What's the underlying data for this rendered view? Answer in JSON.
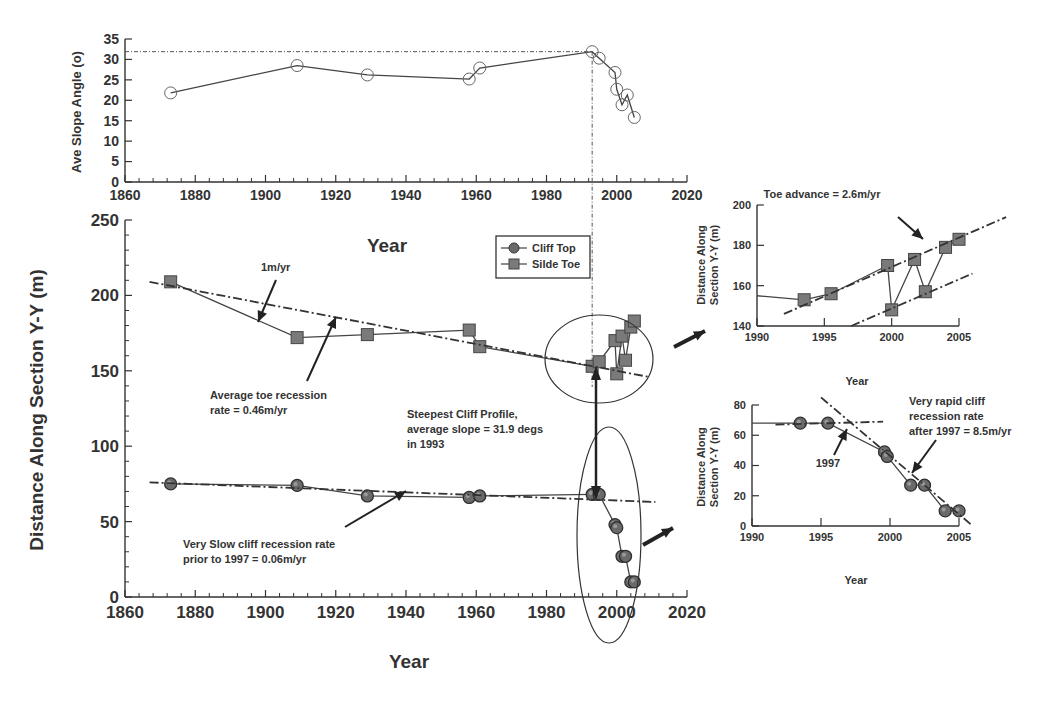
{
  "chart_data": [
    {
      "id": "slope",
      "type": "line",
      "ylabel": "Ave Slope Angle (o)",
      "xlabel": "",
      "xlim": [
        1860,
        2020
      ],
      "ylim": [
        0,
        35
      ],
      "xticks": [
        1860,
        1880,
        1900,
        1920,
        1940,
        1960,
        1980,
        2000,
        2020
      ],
      "yticks": [
        0,
        5,
        10,
        15,
        20,
        25,
        30,
        35
      ],
      "series": [
        {
          "name": "Ave Slope Angle",
          "marker": "open-circle",
          "x": [
            1873,
            1909,
            1929,
            1958,
            1961,
            1993,
            1995,
            1999.5,
            2000,
            2001.5,
            2003,
            2005
          ],
          "y": [
            21.8,
            28.5,
            26.2,
            25.2,
            27.9,
            31.9,
            30.3,
            26.8,
            22.7,
            18.9,
            21.3,
            15.8
          ]
        }
      ],
      "reference_lines": [
        {
          "type": "horizontal",
          "y": 31.9
        },
        {
          "type": "vertical",
          "x": 1993
        }
      ],
      "grid": false
    },
    {
      "id": "main",
      "type": "line",
      "title": "Year",
      "xlabel": "Year",
      "ylabel": "Distance Along Section Y-Y (m)",
      "xlim": [
        1860,
        2020
      ],
      "ylim": [
        0,
        250
      ],
      "xticks": [
        1860,
        1880,
        1900,
        1920,
        1940,
        1960,
        1980,
        2000,
        2020
      ],
      "yticks": [
        0,
        50,
        100,
        150,
        200,
        250
      ],
      "legend": {
        "position": "upper center",
        "entries": [
          "Cliff Top",
          "Silde Toe"
        ]
      },
      "series": [
        {
          "name": "Cliff Top",
          "marker": "filled-sphere",
          "x": [
            1873,
            1909,
            1929,
            1958,
            1961,
            1993,
            1995,
            1999.5,
            2000,
            2001.5,
            2002.5,
            2004,
            2005
          ],
          "y": [
            75,
            74,
            67,
            66,
            67,
            68,
            68,
            48,
            46,
            27,
            27,
            10,
            10
          ]
        },
        {
          "name": "Silde Toe",
          "marker": "filled-square",
          "x": [
            1873,
            1909,
            1929,
            1958,
            1961,
            1993,
            1995,
            1999.5,
            2000,
            2001.5,
            2002.5,
            2004,
            2005
          ],
          "y": [
            209,
            172,
            174,
            177,
            166,
            153,
            156,
            170,
            148,
            173,
            157,
            179,
            183
          ]
        }
      ],
      "trend_lines": [
        {
          "label": "1m/yr",
          "from": [
            1867,
            209
          ],
          "to": [
            2009,
            146
          ]
        },
        {
          "label": "Very Slow cliff recession rate prior to 1997 = 0.06m/yr",
          "from": [
            1867,
            76
          ],
          "to": [
            2011,
            63
          ]
        }
      ],
      "annotations": [
        "1m/yr",
        "Average toe recession rate = 0.46m/yr",
        "Steepest Cliff Profile, average slope = 31.9 degs in 1993",
        "Very Slow cliff recession rate prior to 1997 = 0.06m/yr"
      ],
      "grid": false
    },
    {
      "id": "inset_toe",
      "type": "line",
      "title": "Toe advance = 2.6m/yr",
      "xlabel": "Year",
      "ylabel": "Distance Along Section Y-Y (m)",
      "xlim": [
        1990,
        2005
      ],
      "ylim": [
        140,
        200
      ],
      "xticks": [
        1990,
        1995,
        2000,
        2005
      ],
      "yticks": [
        140,
        160,
        180,
        200
      ],
      "series": [
        {
          "name": "Silde Toe",
          "marker": "filled-square",
          "x": [
            1990,
            1993.5,
            1995.5,
            1999.7,
            2000,
            2001.7,
            2002.5,
            2004,
            2005
          ],
          "y": [
            155,
            153,
            156,
            170,
            148,
            173,
            157,
            179,
            183
          ]
        }
      ],
      "trend_lines": [
        {
          "from": [
            1992,
            146
          ],
          "to": [
            2008.5,
            194
          ]
        },
        {
          "from": [
            1997,
            140
          ],
          "to": [
            2006,
            166
          ]
        }
      ],
      "grid": false
    },
    {
      "id": "inset_cliff",
      "type": "line",
      "xlabel": "Year",
      "ylabel": "Distance Along Section Y-Y (m)",
      "xlim": [
        1990,
        2005
      ],
      "ylim": [
        0,
        80
      ],
      "xticks": [
        1990,
        1995,
        2000,
        2005
      ],
      "yticks": [
        0,
        20,
        40,
        60,
        80
      ],
      "series": [
        {
          "name": "Cliff Top",
          "marker": "filled-sphere",
          "x": [
            1990,
            1993.5,
            1995.5,
            1999.6,
            1999.8,
            2001.5,
            2002.5,
            2004,
            2005
          ],
          "y": [
            68,
            68,
            68,
            49,
            46,
            27,
            27,
            10,
            10
          ]
        }
      ],
      "trend_lines": [
        {
          "from": [
            1991.7,
            67
          ],
          "to": [
            1999.5,
            69
          ]
        },
        {
          "from": [
            1995,
            85
          ],
          "to": [
            2006,
            0
          ]
        }
      ],
      "annotations": [
        "1997",
        "Very rapid cliff recession rate after 1997 = 8.5m/yr"
      ],
      "grid": false
    }
  ],
  "labels": {
    "slope_ylabel": "Ave Slope Angle (o)",
    "main_ylabel": "Distance Along Section Y-Y (m)",
    "main_xlabel": "Year",
    "main_title_year": "Year",
    "legend_cliff": "Cliff Top",
    "legend_toe": "Silde Toe",
    "ann_1myr": "1m/yr",
    "ann_toe_1": "Average toe recession",
    "ann_toe_2": "rate = 0.46m/yr",
    "ann_steep_1": "Steepest Cliff Profile,",
    "ann_steep_2": "average slope = 31.9 degs",
    "ann_steep_3": "in 1993",
    "ann_slow_1": "Very Slow cliff recession rate",
    "ann_slow_2": "prior to 1997 = 0.06m/yr",
    "inset1_title": "Toe advance = 2.6m/yr",
    "inset1_ylabel_1": "Distance Along",
    "inset1_ylabel_2": "Section Y-Y (m)",
    "inset1_xlabel": "Year",
    "inset2_ylabel_1": "Distance Along",
    "inset2_ylabel_2": "Section Y-Y (m)",
    "inset2_xlabel": "Year",
    "ann_1997": "1997",
    "ann_rapid_1": "Very rapid cliff",
    "ann_rapid_2": "recession rate",
    "ann_rapid_3": "after 1997 = 8.5m/yr"
  },
  "colors": {
    "line": "#444444",
    "marker_fill": "#6a6a6a",
    "text": "#333333",
    "background": "#ffffff"
  }
}
